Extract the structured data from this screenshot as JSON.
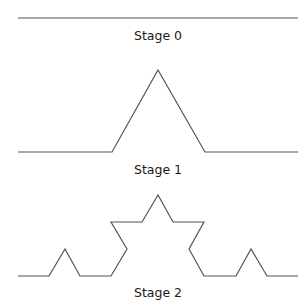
{
  "stroke_color": "#555555",
  "stages": [
    {
      "label": "Stage 0",
      "points": "18,18 298,18"
    },
    {
      "label": "Stage 1",
      "points": "18,152 112,152 158,70 205,152 298,152"
    },
    {
      "label": "Stage 2",
      "points": "18,276 49,276 65,249 80,276 111,276 127,249 111,222 142,222 158,195 173,222 204,222 189,249 204,276 236,276 251,249 267,276 298,276"
    }
  ]
}
